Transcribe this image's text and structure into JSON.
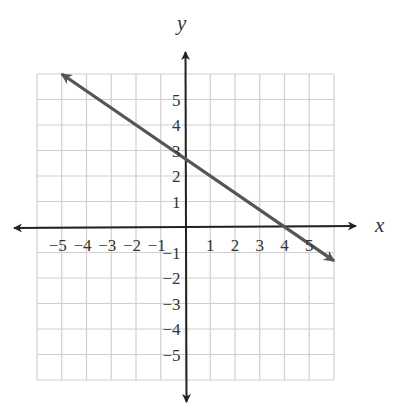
{
  "chart_data": {
    "type": "line",
    "title": "",
    "xlabel": "x",
    "ylabel": "y",
    "xlim": [
      -6,
      6
    ],
    "ylim": [
      -6,
      6
    ],
    "grid": true,
    "x_ticks": [
      -5,
      -4,
      -3,
      -2,
      -1,
      1,
      2,
      3,
      4,
      5
    ],
    "y_ticks": [
      5,
      4,
      3,
      2,
      1,
      -1,
      -2,
      -3,
      -4,
      -5
    ],
    "x_tick_labels": [
      "−5",
      "−4",
      "−3",
      "−2",
      "−1",
      "1",
      "2",
      "3",
      "4",
      "5"
    ],
    "y_tick_labels": [
      "5",
      "4",
      "3",
      "2",
      "1",
      "−1",
      "−2",
      "−3",
      "−4",
      "−5"
    ],
    "series": [
      {
        "name": "line",
        "equation": "y = -2/3 x + 8/3",
        "slope": -0.6667,
        "y_intercept": 2.67,
        "x_intercept": 4,
        "x": [
          -5,
          0,
          4,
          6
        ],
        "y": [
          6,
          2.67,
          0,
          -1.33
        ],
        "arrows": "both ends"
      }
    ],
    "legend": null
  },
  "colors": {
    "grid": "#cfcfcf",
    "axes": "#222222",
    "line": "#555555",
    "text": "#333333"
  }
}
